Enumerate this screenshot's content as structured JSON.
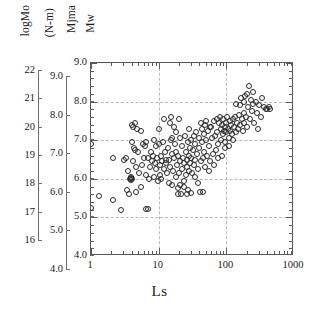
{
  "figure": {
    "xtitle": "Ls",
    "headers": [
      {
        "name": "logmo-header",
        "text": "logMo"
      },
      {
        "name": "units-header",
        "text": "(N-m)"
      },
      {
        "name": "mjma-header",
        "text": "Mjma"
      },
      {
        "name": "mw-header",
        "text": "Mw"
      }
    ]
  },
  "chart_data": {
    "type": "scatter",
    "title": "",
    "xlabel": "Ls",
    "ylabel": "Mw",
    "xscale": "log",
    "xlim": [
      1,
      1000
    ],
    "ylim": [
      4.0,
      9.0
    ],
    "grid": true,
    "legend": null,
    "marker": "open-circle",
    "axes": {
      "x": {
        "label": "Ls",
        "scale": "log",
        "range": [
          1,
          1000
        ],
        "ticks": [
          1,
          10,
          100,
          1000
        ],
        "ticklabels": [
          "1",
          "10",
          "100",
          "1000"
        ]
      },
      "y_primary": {
        "label": "Mw",
        "range": [
          4.0,
          9.0
        ],
        "ticks": [
          4.0,
          5.0,
          6.0,
          7.0,
          8.0,
          9.0
        ],
        "ticklabels": [
          "4.0",
          "5.0",
          "6.0",
          "7.0",
          "8.0",
          "9.0"
        ],
        "gridlines": [
          5.0,
          6.0,
          7.0,
          8.0
        ]
      },
      "y_secondary": {
        "label": "Mjma",
        "range": [
          4.0,
          9.0
        ],
        "ticks": [
          4.0,
          5.0,
          6.0,
          7.0,
          8.0,
          9.0
        ],
        "ticklabels": [
          "4.0",
          "5.0",
          "6.0",
          "7.0",
          "8.0",
          "9.0"
        ]
      },
      "y_tertiary": {
        "label": "logMo (N-m)",
        "range": [
          16,
          22
        ],
        "ticks": [
          16,
          17,
          18,
          19,
          20,
          21,
          22
        ],
        "ticklabels": [
          "16",
          "17",
          "18",
          "19",
          "20",
          "21",
          "22"
        ]
      }
    },
    "points": [
      [
        1.0,
        6.9
      ],
      [
        1.0,
        5.25
      ],
      [
        1.3,
        5.55
      ],
      [
        2.1,
        6.55
      ],
      [
        2.15,
        5.45
      ],
      [
        2.8,
        5.2
      ],
      [
        3.1,
        6.5
      ],
      [
        3.4,
        5.7
      ],
      [
        3.55,
        6.2
      ],
      [
        3.7,
        5.6
      ],
      [
        3.8,
        6.0
      ],
      [
        3.85,
        6.05
      ],
      [
        3.9,
        5.98
      ],
      [
        3.95,
        6.02
      ],
      [
        4.0,
        6.0
      ],
      [
        4.05,
        6.95
      ],
      [
        4.1,
        7.4
      ],
      [
        4.15,
        6.45
      ],
      [
        4.2,
        7.35
      ],
      [
        4.3,
        6.8
      ],
      [
        4.4,
        6.75
      ],
      [
        4.55,
        5.65
      ],
      [
        4.6,
        6.3
      ],
      [
        4.8,
        7.3
      ],
      [
        5.0,
        6.7
      ],
      [
        5.2,
        6.15
      ],
      [
        5.4,
        5.8
      ],
      [
        5.6,
        6.35
      ],
      [
        5.8,
        6.9
      ],
      [
        6.0,
        6.55
      ],
      [
        6.2,
        6.85
      ],
      [
        6.4,
        6.1
      ],
      [
        6.6,
        5.22
      ],
      [
        6.9,
        5.22
      ],
      [
        7.0,
        6.55
      ],
      [
        7.2,
        6.0
      ],
      [
        7.5,
        6.3
      ],
      [
        7.8,
        6.7
      ],
      [
        8.0,
        6.45
      ],
      [
        8.3,
        6.6
      ],
      [
        8.6,
        6.05
      ],
      [
        8.8,
        6.4
      ],
      [
        9.0,
        6.85
      ],
      [
        9.2,
        6.25
      ],
      [
        9.5,
        6.55
      ],
      [
        9.8,
        5.95
      ],
      [
        10.0,
        7.3
      ],
      [
        10.2,
        6.9
      ],
      [
        10.4,
        6.35
      ],
      [
        10.6,
        6.1
      ],
      [
        10.8,
        6.6
      ],
      [
        11.0,
        6.0
      ],
      [
        11.3,
        6.45
      ],
      [
        11.6,
        6.95
      ],
      [
        12.0,
        6.25
      ],
      [
        12.4,
        6.7
      ],
      [
        12.8,
        6.4
      ],
      [
        13.2,
        6.15
      ],
      [
        13.6,
        6.8
      ],
      [
        14.0,
        5.9
      ],
      [
        14.4,
        6.5
      ],
      [
        14.8,
        6.3
      ],
      [
        15.0,
        7.6
      ],
      [
        15.3,
        7.0
      ],
      [
        15.8,
        6.65
      ],
      [
        16.0,
        5.85
      ],
      [
        16.4,
        6.2
      ],
      [
        16.8,
        6.55
      ],
      [
        17.0,
        7.35
      ],
      [
        17.4,
        6.9
      ],
      [
        17.8,
        6.05
      ],
      [
        18.2,
        6.7
      ],
      [
        18.6,
        6.35
      ],
      [
        19.0,
        5.75
      ],
      [
        19.4,
        6.6
      ],
      [
        19.8,
        6.15
      ],
      [
        20.0,
        7.55
      ],
      [
        20.5,
        7.05
      ],
      [
        21.0,
        6.45
      ],
      [
        21.5,
        5.6
      ],
      [
        22.0,
        6.85
      ],
      [
        22.5,
        6.25
      ],
      [
        23.0,
        6.55
      ],
      [
        23.5,
        5.95
      ],
      [
        24.0,
        6.4
      ],
      [
        24.5,
        7.1
      ],
      [
        25.0,
        6.7
      ],
      [
        25.5,
        6.1
      ],
      [
        26.0,
        6.5
      ],
      [
        26.5,
        6.3
      ],
      [
        27.0,
        5.7
      ],
      [
        27.5,
        6.95
      ],
      [
        28.0,
        6.6
      ],
      [
        28.5,
        6.2
      ],
      [
        29.0,
        6.8
      ],
      [
        29.5,
        6.4
      ],
      [
        30.0,
        7.0
      ],
      [
        30.5,
        6.55
      ],
      [
        31.0,
        6.15
      ],
      [
        32.0,
        6.75
      ],
      [
        33.0,
        6.35
      ],
      [
        34.0,
        6.9
      ],
      [
        35.0,
        6.5
      ],
      [
        36.0,
        7.2
      ],
      [
        37.0,
        6.65
      ],
      [
        38.0,
        6.25
      ],
      [
        39.0,
        7.05
      ],
      [
        40.0,
        6.8
      ],
      [
        41.0,
        5.65
      ],
      [
        42.0,
        6.45
      ],
      [
        43.0,
        7.3
      ],
      [
        44.0,
        6.95
      ],
      [
        45.0,
        6.55
      ],
      [
        46.0,
        7.15
      ],
      [
        47.0,
        6.7
      ],
      [
        48.0,
        6.3
      ],
      [
        49.0,
        7.4
      ],
      [
        50.0,
        7.0
      ],
      [
        52.0,
        6.6
      ],
      [
        54.0,
        7.25
      ],
      [
        56.0,
        6.85
      ],
      [
        58.0,
        6.45
      ],
      [
        60.0,
        7.35
      ],
      [
        62.0,
        7.05
      ],
      [
        64.0,
        6.65
      ],
      [
        66.0,
        7.5
      ],
      [
        68.0,
        7.1
      ],
      [
        70.0,
        6.75
      ],
      [
        72.0,
        7.55
      ],
      [
        74.0,
        7.2
      ],
      [
        76.0,
        6.9
      ],
      [
        78.0,
        7.45
      ],
      [
        80.0,
        7.6
      ],
      [
        82.0,
        7.3
      ],
      [
        84.0,
        7.0
      ],
      [
        86.0,
        7.4
      ],
      [
        88.0,
        7.15
      ],
      [
        90.0,
        7.55
      ],
      [
        92.0,
        7.25
      ],
      [
        94.0,
        6.95
      ],
      [
        96.0,
        7.35
      ],
      [
        98.0,
        7.45
      ],
      [
        100.0,
        7.2
      ],
      [
        102.0,
        7.6
      ],
      [
        105.0,
        7.3
      ],
      [
        108.0,
        7.05
      ],
      [
        112.0,
        7.5
      ],
      [
        115.0,
        7.25
      ],
      [
        118.0,
        7.4
      ],
      [
        122.0,
        7.15
      ],
      [
        126.0,
        7.55
      ],
      [
        130.0,
        7.35
      ],
      [
        135.0,
        7.6
      ],
      [
        140.0,
        7.2
      ],
      [
        145.0,
        7.45
      ],
      [
        150.0,
        7.3
      ],
      [
        155.0,
        7.65
      ],
      [
        160.0,
        7.4
      ],
      [
        165.0,
        8.1
      ],
      [
        170.0,
        7.55
      ],
      [
        175.0,
        7.25
      ],
      [
        180.0,
        7.7
      ],
      [
        185.0,
        7.45
      ],
      [
        190.0,
        8.15
      ],
      [
        195.0,
        7.6
      ],
      [
        200.0,
        7.35
      ],
      [
        210.0,
        7.85
      ],
      [
        215.0,
        8.4
      ],
      [
        220.0,
        7.55
      ],
      [
        230.0,
        8.05
      ],
      [
        240.0,
        7.75
      ],
      [
        250.0,
        7.95
      ],
      [
        260.0,
        7.45
      ],
      [
        270.0,
        8.0
      ],
      [
        280.0,
        7.7
      ],
      [
        290.0,
        7.3
      ],
      [
        300.0,
        7.9
      ],
      [
        320.0,
        7.6
      ],
      [
        340.0,
        8.1
      ],
      [
        360.0,
        7.85
      ],
      [
        380.0,
        7.8
      ],
      [
        400.0,
        7.82
      ],
      [
        420.0,
        7.85
      ],
      [
        440.0,
        7.8
      ],
      [
        12.0,
        7.55
      ],
      [
        13.0,
        6.5
      ],
      [
        14.5,
        7.45
      ],
      [
        24.0,
        5.8
      ],
      [
        26.0,
        5.6
      ],
      [
        30.0,
        5.62
      ],
      [
        45.0,
        5.65
      ],
      [
        19.0,
        5.6
      ],
      [
        21.0,
        5.85
      ],
      [
        35.0,
        6.05
      ],
      [
        38.0,
        5.9
      ],
      [
        55.0,
        6.2
      ],
      [
        65.0,
        6.35
      ],
      [
        75.0,
        6.55
      ],
      [
        85.0,
        6.6
      ],
      [
        95.0,
        6.8
      ],
      [
        110.0,
        6.85
      ],
      [
        125.0,
        7.0
      ],
      [
        16.0,
        7.05
      ],
      [
        18.0,
        7.2
      ],
      [
        28.0,
        7.3
      ],
      [
        33.0,
        7.1
      ],
      [
        42.0,
        7.45
      ],
      [
        50.0,
        7.5
      ],
      [
        58.0,
        7.35
      ],
      [
        6.5,
        6.95
      ],
      [
        8.5,
        7.0
      ],
      [
        5.5,
        7.25
      ],
      [
        4.5,
        7.45
      ],
      [
        3.3,
        6.55
      ],
      [
        200.0,
        8.2
      ],
      [
        250.0,
        8.25
      ],
      [
        140.0,
        7.95
      ],
      [
        160.0,
        7.9
      ],
      [
        180.0,
        8.0
      ]
    ]
  }
}
